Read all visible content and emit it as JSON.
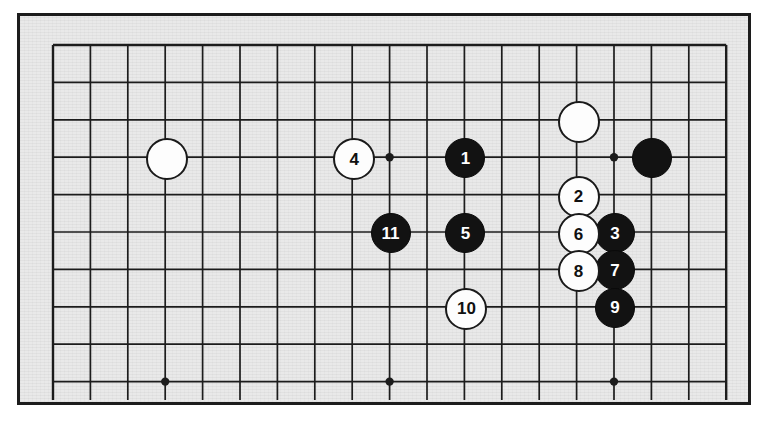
{
  "figure": {
    "type": "go-board-diagram",
    "caption": "",
    "board": {
      "size": 19,
      "visible_columns": 19,
      "visible_rows": 10,
      "cropped": "bottom",
      "grid_spacing_px": 37.4,
      "origin_x_px": 53,
      "origin_y_px": 45,
      "line_color": "#1c1c1c",
      "board_color": "#e9e9e9",
      "frame_color": "#1c1c1c"
    },
    "star_points": [
      {
        "col": 3,
        "row": 3
      },
      {
        "col": 9,
        "row": 3
      },
      {
        "col": 15,
        "row": 3
      },
      {
        "col": 3,
        "row": 9
      },
      {
        "col": 9,
        "row": 9
      },
      {
        "col": 15,
        "row": 9
      }
    ],
    "stones": [
      {
        "label": "",
        "color": "white",
        "col": 3,
        "row": 3
      },
      {
        "label": "",
        "color": "white",
        "col": 14,
        "row": 2
      },
      {
        "label": "",
        "color": "black",
        "col": 16,
        "row": 3
      },
      {
        "label": "1",
        "color": "black",
        "col": 11,
        "row": 3
      },
      {
        "label": "2",
        "color": "white",
        "col": 14,
        "row": 4
      },
      {
        "label": "3",
        "color": "black",
        "col": 15,
        "row": 5
      },
      {
        "label": "4",
        "color": "white",
        "col": 8,
        "row": 3
      },
      {
        "label": "5",
        "color": "black",
        "col": 11,
        "row": 5
      },
      {
        "label": "6",
        "color": "white",
        "col": 14,
        "row": 5
      },
      {
        "label": "7",
        "color": "black",
        "col": 15,
        "row": 6
      },
      {
        "label": "8",
        "color": "white",
        "col": 14,
        "row": 6
      },
      {
        "label": "9",
        "color": "black",
        "col": 15,
        "row": 7
      },
      {
        "label": "10",
        "color": "white",
        "col": 11,
        "row": 7
      },
      {
        "label": "11",
        "color": "black",
        "col": 9,
        "row": 5
      }
    ],
    "stone_style": {
      "radius_px": 19,
      "black_fill": "#121212",
      "white_fill": "#fdfdfd",
      "black_text": "#ffffff",
      "white_text": "#101010",
      "font_size_px": 17
    }
  }
}
